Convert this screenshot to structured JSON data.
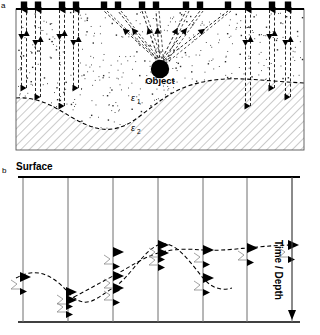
{
  "figure": {
    "type": "diagram",
    "panels": [
      {
        "id": "a",
        "label": "a",
        "description": "Cross-section of subsurface with antennas at surface, stippled upper layer, buried object and dipping lower layer",
        "object_label": "Object",
        "permittivity_upper": "ε1",
        "permittivity_lower": "ε2",
        "antenna_count": 13,
        "antenna_positions": [
          24,
          38,
          62,
          76,
          104,
          118,
          142,
          156,
          186,
          200,
          228,
          248,
          272,
          288
        ],
        "object_position": {
          "x": 160,
          "y": 69
        },
        "ray_fan_targets": [
          104,
          118,
          142,
          156,
          186,
          200,
          228
        ]
      },
      {
        "id": "b",
        "label": "b",
        "description": "Radargram showing traces with diffraction hyperbola from object and reflector from layer boundary",
        "surface_label": "Surface",
        "axis_label": "Time / Depth",
        "trace_count": 7,
        "trace_positions": [
          23,
          68,
          113,
          158,
          203,
          247,
          292
        ],
        "curves": [
          {
            "name": "diffraction-hyperbola",
            "style": "dashed"
          },
          {
            "name": "layer-reflector",
            "style": "dashed"
          }
        ]
      }
    ],
    "colors": {
      "line": "#000000",
      "hatch": "#b8b8b8",
      "stipple": "#333333",
      "trace": "#777777"
    }
  }
}
